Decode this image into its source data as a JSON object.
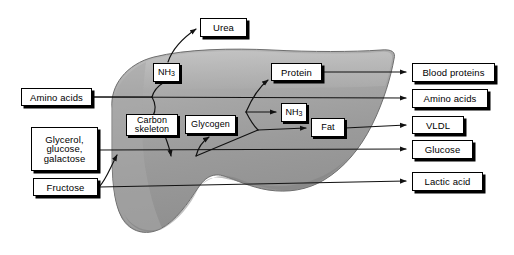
{
  "diagram": {
    "organ": {
      "name": "liver",
      "fill_main": "#9b9b9b",
      "fill_light": "#b4b4b4",
      "fill_shadow": "#8c8c8c",
      "outline": "#6f6f6f"
    },
    "line_color": "#111111",
    "box_fill": "#ffffff",
    "box_border": "#000000",
    "shadow_color": "#000000"
  },
  "inputs": [
    {
      "id": "amino-acids-in",
      "label": "Amino acids",
      "lines": [
        "Amino acids"
      ]
    },
    {
      "id": "glycerol-glucose-galactose",
      "label": "Glycerol, glucose, galactose",
      "lines": [
        "Glycerol,",
        "glucose,",
        "galactose"
      ]
    },
    {
      "id": "fructose",
      "label": "Fructose",
      "lines": [
        "Fructose"
      ]
    }
  ],
  "internal": [
    {
      "id": "ammonia-upper",
      "label": "NH3",
      "text": "NH",
      "subscript": "3"
    },
    {
      "id": "carbon-skeleton",
      "label": "Carbon skeleton",
      "lines": [
        "Carbon",
        "skeleton"
      ]
    },
    {
      "id": "glycogen",
      "label": "Glycogen",
      "lines": [
        "Glycogen"
      ]
    },
    {
      "id": "protein",
      "label": "Protein",
      "lines": [
        "Protein"
      ]
    },
    {
      "id": "ammonia-lower",
      "label": "NH3",
      "text": "NH",
      "subscript": "3"
    },
    {
      "id": "fat",
      "label": "Fat",
      "lines": [
        "Fat"
      ]
    }
  ],
  "outputs": [
    {
      "id": "urea",
      "label": "Urea"
    },
    {
      "id": "blood-proteins",
      "label": "Blood proteins"
    },
    {
      "id": "amino-acids-out",
      "label": "Amino acids"
    },
    {
      "id": "vldl",
      "label": "VLDL"
    },
    {
      "id": "glucose",
      "label": "Glucose"
    },
    {
      "id": "lactic-acid",
      "label": "Lactic acid"
    }
  ]
}
